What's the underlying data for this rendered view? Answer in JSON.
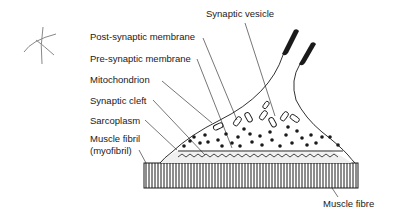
{
  "diagram": {
    "labels": {
      "synaptic_vesicle": "Synaptic vesicle",
      "post_synaptic_membrane": "Post-synaptic membrane",
      "pre_synaptic_membrane": "Pre-synaptic membrane",
      "mitochondrion": "Mitochondrion",
      "synaptic_cleft": "Synaptic cleft",
      "sarcoplasm": "Sarcoplasm",
      "muscle_fibril_line1": "Muscle fibril",
      "muscle_fibril_line2": "(myofibril)",
      "muscle_fibre": "Muscle fibre"
    },
    "colors": {
      "ink": "#1a1a1a",
      "pencil": "#777777",
      "background": "#ffffff"
    }
  }
}
